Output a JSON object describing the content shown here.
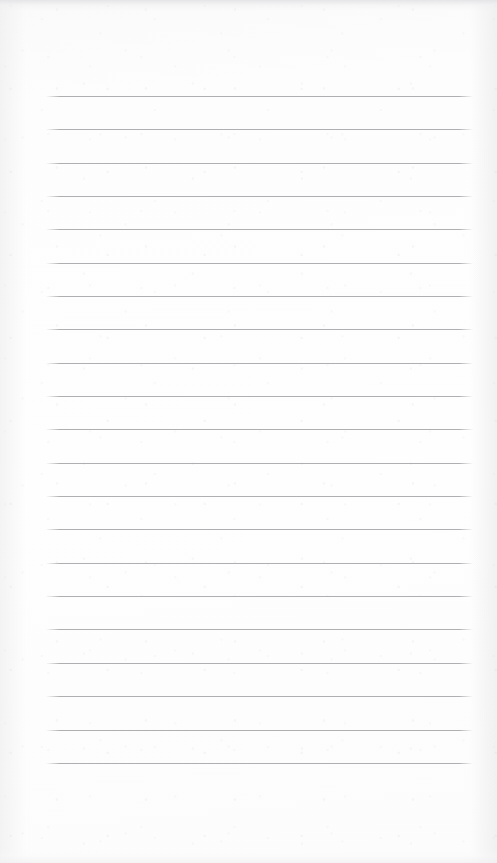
{
  "document": {
    "title": "Lined Notebook Page",
    "kind": "blank-ruled-paper",
    "has_text_content": false,
    "visible_text": "",
    "page_width_px": 497,
    "page_height_px": 863
  },
  "appearance": {
    "paper_color": "#fdfdfd",
    "paper_edge_color": "#f0f0f2",
    "rule_color": "#a9a9ac",
    "rule_thickness_px": 1
  },
  "ruling": {
    "line_count": 21,
    "left_x_px": 46,
    "right_x_px": 473,
    "line_width_px": 427,
    "first_line_y_px": 96,
    "line_spacing_px": 33.35,
    "last_line_y_px": 763,
    "top_margin_px": 96,
    "bottom_margin_px": 100,
    "left_margin_px": 46,
    "right_margin_px": 24,
    "line_y_positions": [
      96,
      129,
      163,
      196,
      229,
      263,
      296,
      329,
      363,
      396,
      429,
      463,
      496,
      529,
      563,
      596,
      629,
      663,
      696,
      730,
      763
    ]
  },
  "regions": {
    "header_blank_label": "",
    "body_blank_label": "",
    "footer_blank_label": ""
  }
}
